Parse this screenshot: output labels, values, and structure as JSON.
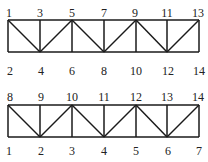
{
  "diagrams": [
    {
      "name": "truss-top",
      "top_labels": [
        "1",
        "3",
        "5",
        "7",
        "9",
        "11",
        "13"
      ],
      "bottom_labels": [
        "2",
        "4",
        "6",
        "8",
        "10",
        "12",
        "14"
      ]
    },
    {
      "name": "truss-bottom",
      "top_labels": [
        "8",
        "9",
        "10",
        "11",
        "12",
        "13",
        "14"
      ],
      "bottom_labels": [
        "1",
        "2",
        "3",
        "4",
        "5",
        "6",
        "7"
      ]
    }
  ],
  "colors": {
    "line": "#1a1a1a",
    "text": "#222222"
  }
}
